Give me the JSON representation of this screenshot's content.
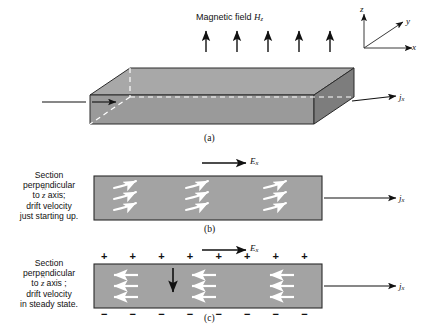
{
  "figure": {
    "title_label": "Magnetic field",
    "field_symbol": "H",
    "field_subscript": "z",
    "axes": {
      "z": "z",
      "y": "y",
      "x": "x"
    },
    "colors": {
      "slab_top": "#a8a8a8",
      "slab_front": "#9a9a9a",
      "slab_end": "#7d7d7d",
      "slab_left": "#8f8f8f",
      "panel_fill": "#a3a3a3",
      "outline": "#2b2b2b",
      "hidden_edge": "#ffffff",
      "arrow": "#111111",
      "carrier_arrow": "#ffffff"
    }
  },
  "panels": [
    {
      "id": "a",
      "letter": "(a)",
      "field_arrow_count": 5,
      "current_label": {
        "symbol": "j",
        "subscript": "x"
      }
    },
    {
      "id": "b",
      "letter": "(b)",
      "caption_lines": [
        "Section",
        "perpendicular",
        "to z axis;",
        "drift velocity",
        "just starting up."
      ],
      "e_field_label": {
        "symbol": "E",
        "subscript": "x"
      },
      "current_label": {
        "symbol": "j",
        "subscript": "x"
      },
      "carrier_groups": 3,
      "carriers_per_group": 3,
      "carrier_path": "curved"
    },
    {
      "id": "c",
      "letter": "(c)",
      "caption_lines": [
        "Section",
        "perpendicular",
        "to z axis ;",
        "drift velocity",
        "in steady state."
      ],
      "e_field_label": {
        "symbol": "E",
        "subscript": "x"
      },
      "hall_field_label": {
        "symbol": "E",
        "subscript": "y"
      },
      "current_label": {
        "symbol": "j",
        "subscript": "x"
      },
      "positive_charges": [
        "+",
        "+",
        "+",
        "+",
        "+",
        "+",
        "+",
        "+"
      ],
      "negative_charges": [
        "−",
        "−",
        "−",
        "−",
        "−",
        "−",
        "−",
        "−"
      ],
      "carrier_groups": 3,
      "carriers_per_group": 3,
      "carrier_path": "straight-left"
    }
  ]
}
